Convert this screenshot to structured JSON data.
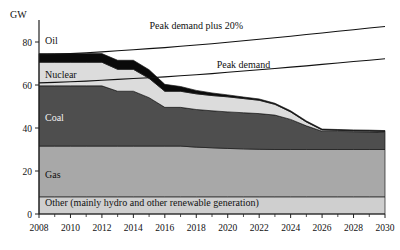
{
  "chart_data": {
    "type": "area",
    "title": "",
    "subtitle": "",
    "xlabel": "",
    "ylabel": "GW",
    "ylim": [
      0,
      90
    ],
    "xlim": [
      2008,
      2030
    ],
    "grid": false,
    "legend_position": "inline-labels",
    "x": [
      2008,
      2009,
      2010,
      2011,
      2012,
      2013,
      2014,
      2015,
      2016,
      2017,
      2018,
      2019,
      2020,
      2021,
      2022,
      2023,
      2024,
      2025,
      2026,
      2027,
      2028,
      2029,
      2030
    ],
    "y_ticks": [
      0,
      20,
      40,
      60,
      80
    ],
    "x_ticks": [
      2008,
      2010,
      2012,
      2014,
      2016,
      2018,
      2020,
      2022,
      2024,
      2026,
      2028,
      2030
    ],
    "x_minor_ticks": [
      2009,
      2011,
      2013,
      2015,
      2017,
      2019,
      2021,
      2023,
      2025,
      2027,
      2029
    ],
    "stacked_series": [
      {
        "name": "Other (mainly hydro and other renewable generation)",
        "label": "Other (mainly hydro and other renewable generation)",
        "color": "#cfcfcf",
        "values": [
          8,
          8,
          8,
          8,
          8,
          8,
          8,
          8,
          8,
          8,
          8,
          8,
          8,
          8,
          8,
          8,
          8,
          8,
          8,
          8,
          8,
          8,
          8
        ]
      },
      {
        "name": "Gas",
        "label": "Gas",
        "color": "#a8a8a8",
        "values": [
          23.6,
          23.6,
          23.6,
          23.6,
          23.6,
          23.6,
          23.6,
          23.6,
          23.6,
          23.6,
          23.1,
          22.8,
          22.5,
          22.3,
          22.1,
          22.0,
          22.0,
          22.0,
          22.0,
          22.0,
          22.0,
          22.0,
          22.0
        ]
      },
      {
        "name": "Coal",
        "label": "Coal",
        "color": "#4e4e4e",
        "values": [
          28.0,
          28.0,
          28.0,
          28.0,
          28.0,
          25.5,
          25.5,
          22.5,
          18.0,
          18.0,
          17.5,
          17.2,
          17.0,
          16.8,
          16.6,
          16.0,
          14.0,
          11.0,
          8.5,
          8.4,
          8.3,
          8.2,
          8.0
        ]
      },
      {
        "name": "Nuclear",
        "label": "Nuclear",
        "color": "#dcdcdc",
        "values": [
          11.0,
          11.0,
          11.0,
          11.0,
          11.0,
          10.2,
          10.2,
          9.0,
          7.5,
          7.5,
          7.3,
          7.1,
          7.0,
          6.6,
          6.2,
          5.0,
          3.5,
          1.8,
          0.6,
          0.5,
          0.4,
          0.4,
          0.4
        ]
      },
      {
        "name": "Oil",
        "label": "Oil",
        "color": "#0a0a0a",
        "values": [
          4.0,
          4.0,
          4.0,
          4.0,
          4.0,
          4.2,
          4.2,
          4.0,
          3.2,
          2.2,
          1.6,
          1.2,
          0.9,
          0.7,
          0.6,
          0.5,
          0.5,
          0.5,
          0.4,
          0.4,
          0.4,
          0.4,
          0.4
        ]
      }
    ],
    "line_series": [
      {
        "name": "Peak demand",
        "label": "Peak demand",
        "color": "#111111",
        "values": [
          61.0,
          61.2,
          61.5,
          61.8,
          62.2,
          62.6,
          63.0,
          63.4,
          63.8,
          64.3,
          64.8,
          65.3,
          65.9,
          66.5,
          67.1,
          67.7,
          68.3,
          68.9,
          69.6,
          70.2,
          70.9,
          71.5,
          72.2
        ]
      },
      {
        "name": "Peak demand plus 20%",
        "label": "Peak demand plus 20%",
        "color": "#111111",
        "values": [
          74.0,
          74.3,
          74.6,
          75.0,
          75.4,
          75.9,
          76.4,
          76.9,
          77.4,
          78.0,
          78.6,
          79.2,
          79.9,
          80.6,
          81.3,
          82.0,
          82.7,
          83.5,
          84.2,
          85.0,
          85.7,
          86.5,
          87.2
        ]
      }
    ],
    "annotations": [
      {
        "text": "Peak demand plus 20%",
        "x": 2018,
        "y": 86
      },
      {
        "text": "Peak demand",
        "x": 2021,
        "y": 68
      }
    ]
  }
}
